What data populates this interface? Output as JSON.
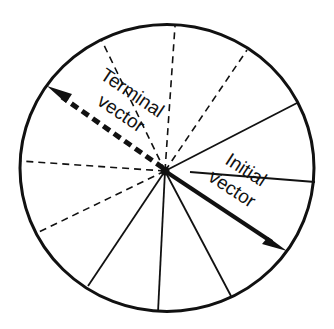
{
  "diagram": {
    "type": "circle-vector-rotation",
    "labels": {
      "terminal_line1": "Terminal",
      "terminal_line2": "vector",
      "initial_line1": "Initial",
      "initial_line2": "vector"
    },
    "colors": {
      "stroke": "#111111",
      "background": "#ffffff"
    },
    "spokes": {
      "dashed_count": 5,
      "solid_count": 6
    }
  }
}
